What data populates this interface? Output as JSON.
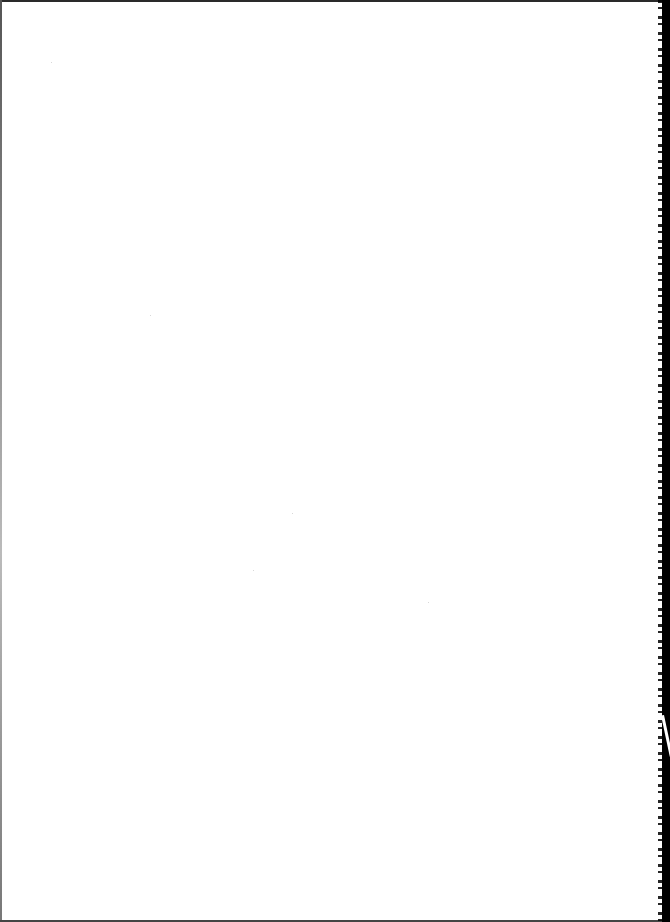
{
  "document": {
    "type": "scanned-page",
    "content": "",
    "page_color": "#ffffff",
    "border_color": "#000000"
  }
}
